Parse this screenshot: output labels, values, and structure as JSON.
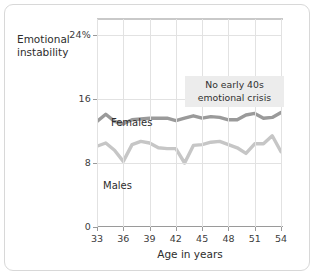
{
  "chart_data": {
    "type": "line",
    "title": "",
    "xlabel": "Age in years",
    "ylabel": "Emotional instability",
    "xlim": [
      33,
      54
    ],
    "ylim": [
      0,
      26
    ],
    "grid": true,
    "legend_position": "inline-labels",
    "xticks": [
      33,
      36,
      39,
      42,
      45,
      48,
      51,
      54
    ],
    "xtick_labels": [
      "33",
      "36",
      "39",
      "42",
      "45",
      "48",
      "51",
      "54"
    ],
    "yticks": [
      0,
      8,
      16,
      24
    ],
    "ytick_labels": [
      "0",
      "8",
      "16",
      "24%"
    ],
    "annotations": [
      {
        "text": "No early 40s emotional crisis",
        "x": 46,
        "y": 21
      }
    ],
    "x": [
      33,
      34,
      35,
      36,
      37,
      38,
      39,
      40,
      41,
      42,
      43,
      44,
      45,
      46,
      47,
      48,
      49,
      50,
      51,
      52,
      53,
      54
    ],
    "series": [
      {
        "name": "Females",
        "color": "#9a9a9a",
        "values": [
          13.2,
          14.1,
          13.2,
          12.9,
          13.4,
          13.5,
          13.6,
          13.6,
          13.6,
          13.3,
          13.6,
          13.9,
          13.6,
          13.8,
          13.7,
          13.4,
          13.4,
          14.0,
          14.2,
          13.6,
          13.7,
          14.3
        ]
      },
      {
        "name": "Males",
        "color": "#c6c6c6",
        "values": [
          10.1,
          10.5,
          9.6,
          8.2,
          10.3,
          10.7,
          10.5,
          9.9,
          9.8,
          9.8,
          8.0,
          10.2,
          10.3,
          10.6,
          10.7,
          10.3,
          9.9,
          9.2,
          10.4,
          10.4,
          11.4,
          9.4
        ]
      }
    ],
    "series_labels": {
      "females": "Females",
      "males": "Males"
    }
  }
}
